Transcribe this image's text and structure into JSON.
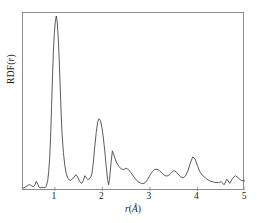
{
  "figure": {
    "axis_color": "#8d8d8d",
    "curve_color": "#3d3d3d",
    "background": "#ffffff"
  },
  "axes": {
    "ylabel_prefix": "RDF(",
    "ylabel_var": "r",
    "ylabel_suffix": ")",
    "xlabel_prefix": "",
    "xlabel_var": "r",
    "xlabel_unit_open": "(",
    "xlabel_unit": "Å",
    "xlabel_unit_close": ")",
    "xtick_labels": [
      "1",
      "2",
      "3",
      "4",
      "5"
    ],
    "ytick_labels": []
  },
  "chart_data": {
    "type": "line",
    "title": "",
    "subtitle": "",
    "xlabel": "r(Å)",
    "ylabel": "RDF(r)",
    "xlim": [
      0.33,
      5.0
    ],
    "ylim": [
      0.0,
      1.0
    ],
    "xticks": [
      1,
      2,
      3,
      4,
      5
    ],
    "yticks": [],
    "grid": false,
    "legend": null,
    "annotations": [],
    "series": [
      {
        "name": "RDF(r)",
        "color": "#3d3d3d",
        "x": [
          0.33,
          0.38,
          0.43,
          0.47,
          0.51,
          0.55,
          0.58,
          0.61,
          0.64,
          0.67,
          0.7,
          0.73,
          0.76,
          0.79,
          0.82,
          0.85,
          0.87,
          0.89,
          0.91,
          0.93,
          0.95,
          0.97,
          0.99,
          1.01,
          1.03,
          1.05,
          1.07,
          1.09,
          1.11,
          1.13,
          1.15,
          1.18,
          1.21,
          1.24,
          1.27,
          1.3,
          1.33,
          1.36,
          1.4,
          1.44,
          1.48,
          1.52,
          1.56,
          1.6,
          1.63,
          1.66,
          1.69,
          1.72,
          1.75,
          1.78,
          1.81,
          1.84,
          1.87,
          1.9,
          1.93,
          1.96,
          1.99,
          2.02,
          2.05,
          2.07,
          2.09,
          2.11,
          2.13,
          2.15,
          2.18,
          2.21,
          2.25,
          2.3,
          2.35,
          2.4,
          2.45,
          2.5,
          2.55,
          2.6,
          2.65,
          2.7,
          2.75,
          2.8,
          2.85,
          2.9,
          2.95,
          3.0,
          3.05,
          3.1,
          3.15,
          3.2,
          3.25,
          3.3,
          3.35,
          3.4,
          3.45,
          3.5,
          3.55,
          3.6,
          3.65,
          3.7,
          3.75,
          3.8,
          3.85,
          3.9,
          3.95,
          4.0,
          4.05,
          4.12,
          4.2,
          4.28,
          4.36,
          4.44,
          4.5,
          4.56,
          4.62,
          4.68,
          4.74,
          4.8,
          4.86,
          4.92,
          5.0
        ],
        "y": [
          0.01,
          0.018,
          0.026,
          0.031,
          0.024,
          0.018,
          0.028,
          0.05,
          0.034,
          0.016,
          0.012,
          0.016,
          0.014,
          0.012,
          0.022,
          0.055,
          0.105,
          0.18,
          0.3,
          0.47,
          0.65,
          0.8,
          0.905,
          0.968,
          1.0,
          0.965,
          0.88,
          0.76,
          0.61,
          0.46,
          0.33,
          0.215,
          0.14,
          0.095,
          0.07,
          0.058,
          0.055,
          0.062,
          0.072,
          0.088,
          0.075,
          0.05,
          0.038,
          0.055,
          0.082,
          0.07,
          0.062,
          0.063,
          0.07,
          0.095,
          0.16,
          0.25,
          0.33,
          0.39,
          0.41,
          0.398,
          0.36,
          0.3,
          0.225,
          0.165,
          0.11,
          0.06,
          0.03,
          0.06,
          0.15,
          0.225,
          0.195,
          0.155,
          0.135,
          0.12,
          0.118,
          0.125,
          0.118,
          0.1,
          0.08,
          0.062,
          0.048,
          0.04,
          0.036,
          0.042,
          0.06,
          0.085,
          0.105,
          0.118,
          0.12,
          0.112,
          0.098,
          0.085,
          0.08,
          0.085,
          0.098,
          0.112,
          0.105,
          0.088,
          0.075,
          0.07,
          0.082,
          0.11,
          0.155,
          0.19,
          0.178,
          0.14,
          0.105,
          0.08,
          0.062,
          0.05,
          0.044,
          0.042,
          0.048,
          0.03,
          0.062,
          0.038,
          0.068,
          0.082,
          0.07,
          0.055,
          0.052
        ]
      }
    ]
  }
}
